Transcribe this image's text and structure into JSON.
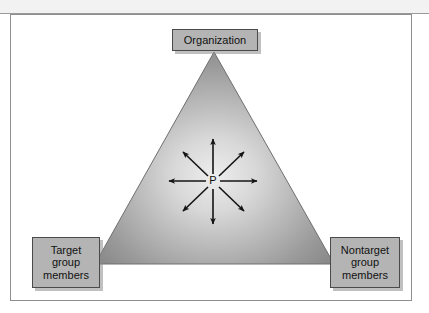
{
  "figure": {
    "type": "triangle-diagram",
    "shape": {
      "name": "triangle",
      "fill_center_color": "#e8e8e8",
      "fill_edge_color": "#8c8c8c",
      "stroke_color": "#6f6f6f"
    },
    "center_node": {
      "label": "P",
      "name": "person-node"
    },
    "arrows": {
      "count": 8,
      "color": "#111111",
      "directions": [
        "north",
        "northeast",
        "east",
        "southeast",
        "south",
        "southwest",
        "west",
        "northwest"
      ]
    },
    "labels": {
      "top": {
        "name": "organization",
        "lines": [
          "Organization"
        ]
      },
      "bottom_left": {
        "name": "target-group-members",
        "lines": [
          "Target",
          "group",
          "members"
        ]
      },
      "bottom_right": {
        "name": "nontarget-group-members",
        "lines": [
          "Nontarget",
          "group",
          "members"
        ]
      }
    },
    "colors": {
      "label_box_fill": "#b4b4b4",
      "label_box_border": "#4a4a4a",
      "frame_border": "#8e8e8e",
      "page_background": "#ffffff",
      "scan_band": "#f2f2f2"
    }
  }
}
